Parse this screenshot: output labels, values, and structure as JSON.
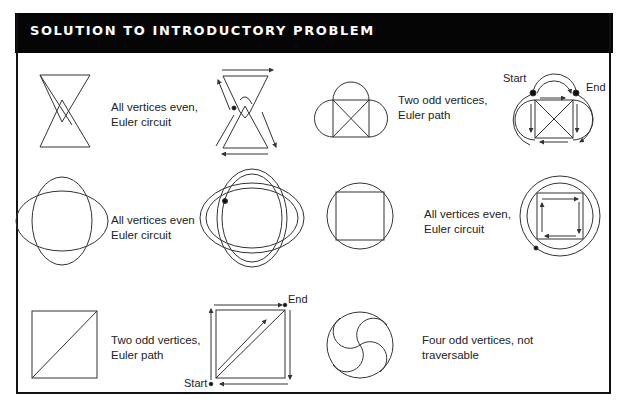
{
  "header": {
    "title": "SOLUTION TO INTRODUCTORY PROBLEM"
  },
  "figures": [
    {
      "id": "bowtie",
      "caption_line1": "All vertices even,",
      "caption_line2": "Euler circuit"
    },
    {
      "id": "box-with-arcs",
      "caption_line1": "Two odd vertices,",
      "caption_line2": "Euler path",
      "start_label": "Start",
      "end_label": "End"
    },
    {
      "id": "overlapping-ellipses",
      "caption_line1": "All vertices even",
      "caption_line2": "Euler circuit"
    },
    {
      "id": "square-in-circle",
      "caption_line1": "All vertices even,",
      "caption_line2": "Euler circuit"
    },
    {
      "id": "square-with-diagonal",
      "caption_line1": "Two odd vertices,",
      "caption_line2": "Euler path",
      "start_label": "Start",
      "end_label": "End"
    },
    {
      "id": "pinwheel-circle",
      "caption_line1": "Four odd vertices, not",
      "caption_line2": "traversable"
    }
  ],
  "colors": {
    "header_bg": "#050505",
    "header_text": "#ffffff",
    "line": "#333333"
  }
}
